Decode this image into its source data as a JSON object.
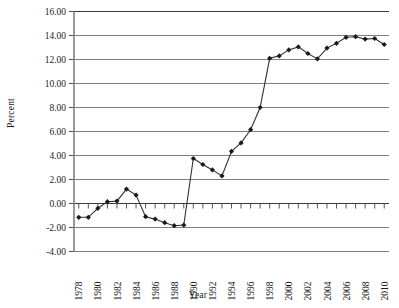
{
  "chart_data": {
    "type": "line",
    "title": "",
    "xlabel": "Year",
    "ylabel": "Percent",
    "grid": true,
    "legend": false,
    "xlim": [
      1977.5,
      2010.5
    ],
    "ylim": [
      -4.0,
      16.0
    ],
    "ytick_labels": [
      "16.00",
      "14.00",
      "12.00",
      "10.00",
      "8.00",
      "6.00",
      "4.00",
      "2.00",
      "0.00",
      "-2.00",
      "-4.00"
    ],
    "ytick_values": [
      16,
      14,
      12,
      10,
      8,
      6,
      4,
      2,
      0,
      -2,
      -4
    ],
    "xtick_labels": [
      "1978",
      "1980",
      "1982",
      "1984",
      "1986",
      "1988",
      "1990",
      "1992",
      "1994",
      "1996",
      "1998",
      "2000",
      "2002",
      "2004",
      "2006",
      "2008",
      "2010"
    ],
    "xtick_values": [
      1978,
      1980,
      1982,
      1984,
      1986,
      1988,
      1990,
      1992,
      1994,
      1996,
      1998,
      2000,
      2002,
      2004,
      2006,
      2008,
      2010
    ],
    "marker": "diamond",
    "line_color": "#333333",
    "marker_color": "#1a1a1a",
    "grid_color": "#808080",
    "axis_color": "#808080",
    "x": [
      1978,
      1979,
      1980,
      1981,
      1982,
      1983,
      1984,
      1985,
      1986,
      1987,
      1988,
      1989,
      1990,
      1991,
      1992,
      1993,
      1994,
      1995,
      1996,
      1997,
      1998,
      1999,
      2000,
      2001,
      2002,
      2003,
      2004,
      2005,
      2006,
      2007,
      2008,
      2009,
      2010
    ],
    "values": [
      -1.15,
      -1.15,
      -0.4,
      0.15,
      0.2,
      1.2,
      0.7,
      -1.1,
      -1.3,
      -1.6,
      -1.85,
      -1.8,
      3.75,
      3.25,
      2.8,
      2.3,
      4.35,
      5.05,
      6.15,
      8.0,
      12.1,
      12.3,
      12.8,
      13.05,
      12.5,
      12.05,
      12.95,
      13.35,
      13.85,
      13.9,
      13.7,
      13.75,
      13.25
    ],
    "series_name": "Percent"
  }
}
